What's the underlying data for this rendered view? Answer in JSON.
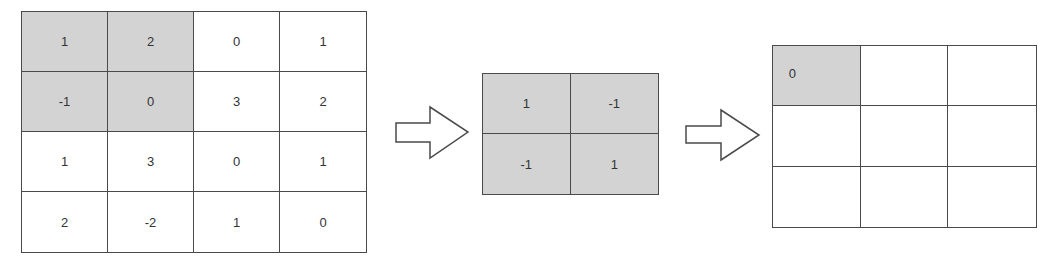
{
  "diagram": {
    "input_matrix": {
      "rows": 4,
      "cols": 4,
      "values": [
        [
          "1",
          "2",
          "0",
          "1"
        ],
        [
          "-1",
          "0",
          "3",
          "2"
        ],
        [
          "1",
          "3",
          "0",
          "1"
        ],
        [
          "2",
          "-2",
          "1",
          "0"
        ]
      ],
      "shaded_region": {
        "row_start": 0,
        "row_end": 1,
        "col_start": 0,
        "col_end": 1
      }
    },
    "kernel": {
      "rows": 2,
      "cols": 2,
      "values": [
        [
          "1",
          "-1"
        ],
        [
          "-1",
          "1"
        ]
      ],
      "shaded": true
    },
    "output_matrix": {
      "rows": 3,
      "cols": 3,
      "values": [
        [
          "0",
          "",
          ""
        ],
        [
          "",
          "",
          ""
        ],
        [
          "",
          "",
          ""
        ]
      ],
      "shaded_cell": {
        "row": 0,
        "col": 0
      }
    },
    "arrows": [
      {
        "from": "input_matrix",
        "to": "kernel",
        "icon": "right-arrow-outline"
      },
      {
        "from": "kernel",
        "to": "output_matrix",
        "icon": "right-arrow-outline"
      }
    ],
    "colors": {
      "shade": "#d3d3d3",
      "border": "#4a4a4a",
      "text": "#333333",
      "background": "#ffffff"
    }
  }
}
